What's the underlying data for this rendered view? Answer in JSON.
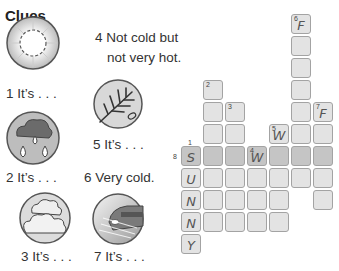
{
  "title": "Clues",
  "clues": {
    "c1": "1  It’s . . .",
    "c2": "2  It’s . . .",
    "c3": "3  It’s . . .",
    "c4a": "4  Not cold but",
    "c4b": "not very hot.",
    "c5": "5  It’s . . .",
    "c6": "6  Very cold.",
    "c7": "7  It’s . . ."
  },
  "icons": {
    "c1": "sunny-icon",
    "c2": "rainy-icon",
    "c3": "cloudy-icon",
    "c5": "windy-icon",
    "c7": "foggy-icon"
  },
  "grid": {
    "cell_size": 22,
    "origin_x": 181,
    "origin_y": 14,
    "outside_labels": {
      "one": "1",
      "eight": "8"
    },
    "cells": [
      {
        "r": 0,
        "c": 5,
        "num": "6",
        "letter": "F"
      },
      {
        "r": 1,
        "c": 5
      },
      {
        "r": 2,
        "c": 5
      },
      {
        "r": 3,
        "c": 1,
        "num": "2"
      },
      {
        "r": 3,
        "c": 5
      },
      {
        "r": 4,
        "c": 1
      },
      {
        "r": 4,
        "c": 2,
        "num": "3"
      },
      {
        "r": 4,
        "c": 5
      },
      {
        "r": 4,
        "c": 6,
        "num": "7",
        "letter": "F"
      },
      {
        "r": 5,
        "c": 1
      },
      {
        "r": 5,
        "c": 2
      },
      {
        "r": 5,
        "c": 4,
        "num": "5",
        "letter": "W"
      },
      {
        "r": 5,
        "c": 5
      },
      {
        "r": 5,
        "c": 6
      },
      {
        "r": 6,
        "c": 0,
        "letter": "S",
        "dark": true
      },
      {
        "r": 6,
        "c": 1,
        "dark": true
      },
      {
        "r": 6,
        "c": 2,
        "dark": true
      },
      {
        "r": 6,
        "c": 3,
        "num": "4",
        "letter": "W",
        "dark": true
      },
      {
        "r": 6,
        "c": 4,
        "dark": true
      },
      {
        "r": 6,
        "c": 5,
        "dark": true
      },
      {
        "r": 6,
        "c": 6,
        "dark": true
      },
      {
        "r": 7,
        "c": 0,
        "letter": "U"
      },
      {
        "r": 7,
        "c": 1
      },
      {
        "r": 7,
        "c": 2
      },
      {
        "r": 7,
        "c": 3
      },
      {
        "r": 7,
        "c": 4
      },
      {
        "r": 7,
        "c": 5
      },
      {
        "r": 7,
        "c": 6
      },
      {
        "r": 8,
        "c": 0,
        "letter": "N"
      },
      {
        "r": 8,
        "c": 1
      },
      {
        "r": 8,
        "c": 2
      },
      {
        "r": 8,
        "c": 3
      },
      {
        "r": 8,
        "c": 4
      },
      {
        "r": 8,
        "c": 6
      },
      {
        "r": 9,
        "c": 0,
        "letter": "N"
      },
      {
        "r": 9,
        "c": 1
      },
      {
        "r": 9,
        "c": 2
      },
      {
        "r": 9,
        "c": 3
      },
      {
        "r": 9,
        "c": 4
      },
      {
        "r": 10,
        "c": 0,
        "letter": "Y"
      }
    ]
  }
}
